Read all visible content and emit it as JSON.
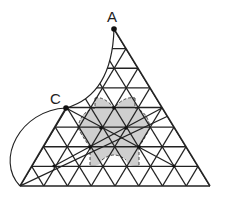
{
  "diagram": {
    "type": "geometry-triangular-grid",
    "grid_rows": 8,
    "triangle": {
      "apex": [
        114,
        29
      ],
      "bottom_left": [
        20,
        186
      ],
      "bottom_right": [
        210,
        186
      ]
    },
    "points": [
      {
        "label": "A",
        "x": 114,
        "y": 29,
        "label_x": 107,
        "label_y": 22
      },
      {
        "label": "C",
        "x": 66,
        "y": 108,
        "label_x": 50,
        "label_y": 104
      }
    ],
    "node_dots": [
      [
        114,
        108
      ],
      [
        101,
        128
      ],
      [
        126,
        128
      ],
      [
        90,
        147
      ],
      [
        139,
        147
      ],
      [
        54,
        166
      ],
      [
        174,
        166
      ]
    ],
    "chords": [
      [
        [
          66,
          108
        ],
        [
          174,
          166
        ]
      ],
      [
        [
          54,
          166
        ],
        [
          162,
          108
        ]
      ]
    ],
    "arcs": {
      "inner_A_to_C": "concave arc from A down to C",
      "outer_C_to_bottom_left": "convex arc from C bulging left to the bottom-left corner"
    },
    "shaded_region": {
      "fill": "#cfcfcf",
      "boundary_style": "dashed"
    },
    "colors": {
      "line": "#222222",
      "shade": "#cfcfcf",
      "background": "#ffffff"
    }
  }
}
